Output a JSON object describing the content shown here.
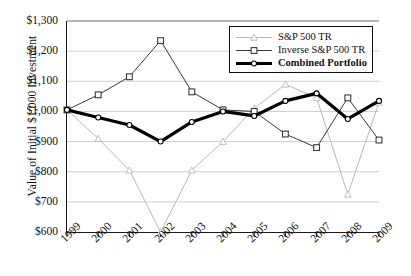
{
  "chart_data": {
    "type": "line",
    "title": "",
    "xlabel": "",
    "ylabel": "Value of Initial $1,000 Investment",
    "categories": [
      "1999",
      "2000",
      "2001",
      "2002",
      "2003",
      "2004",
      "2005",
      "2006",
      "2007",
      "2008",
      "2009"
    ],
    "x": [
      1999,
      2000,
      2001,
      2002,
      2003,
      2004,
      2005,
      2006,
      2007,
      2008,
      2009
    ],
    "ylim": [
      600,
      1300
    ],
    "yticks": [
      600,
      700,
      800,
      900,
      1000,
      1100,
      1200,
      1300
    ],
    "ytick_labels": [
      "$600",
      "$700",
      "$800",
      "$900",
      "$1,000",
      "$1,100",
      "$1,200",
      "$1,300"
    ],
    "grid": true,
    "legend_position": "top-right",
    "series": [
      {
        "name": "S&P 500 TR",
        "marker": "triangle",
        "color": "#b8b8b8",
        "line_width": 1,
        "values": [
          1005,
          910,
          805,
          600,
          805,
          900,
          1010,
          1090,
          1045,
          725,
          1030
        ]
      },
      {
        "name": "Inverse S&P 500 TR",
        "marker": "square",
        "color": "#3a3a3a",
        "line_width": 1,
        "values": [
          1005,
          1055,
          1115,
          1235,
          1065,
          1005,
          1000,
          925,
          880,
          1045,
          905
        ]
      },
      {
        "name": "Combined Portfolio",
        "marker": "circle",
        "color": "#000000",
        "line_width": 3.2,
        "values": [
          1005,
          980,
          955,
          900,
          965,
          1000,
          985,
          1035,
          1060,
          975,
          1035
        ]
      }
    ]
  },
  "legend": {
    "items": [
      {
        "label": "S&P 500 TR",
        "bold": false
      },
      {
        "label": "Inverse S&P 500 TR",
        "bold": false
      },
      {
        "label": "Combined Portfolio",
        "bold": true
      }
    ]
  }
}
